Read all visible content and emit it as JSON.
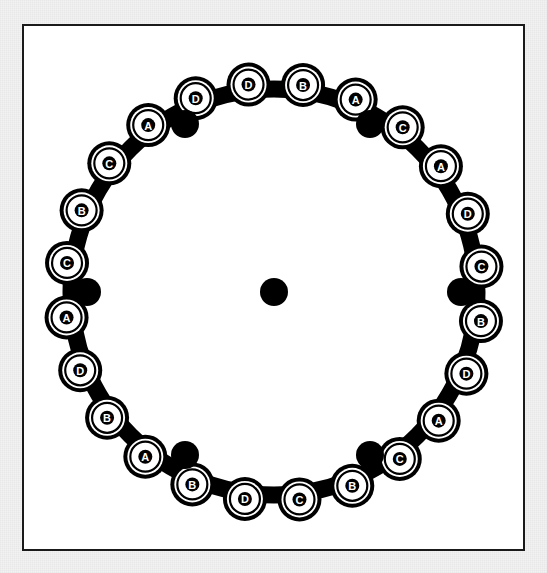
{
  "figure": {
    "type": "diagram",
    "frame": {
      "border_color": "#1a1a1a",
      "fill_color": "#ffffff",
      "mat_color": "#f1f1f1",
      "x": 22,
      "y": 24,
      "width": 503,
      "height": 527
    },
    "ring": {
      "center_x": 250,
      "center_y": 266,
      "inner_radius": 186,
      "band_radius": 203,
      "band_thickness": 17,
      "bead_orbit_radius": 209,
      "stroke_color": "#000000",
      "fill_color": "#ffffff"
    },
    "bead_style": {
      "outer_radius": 22,
      "ring_gap_radius": 18,
      "inner_ring_radius": 15,
      "letter_disc_radius": 7,
      "letter_color": "#ffffff",
      "disc_color": "#000000",
      "body_color": "#ffffff",
      "outline_color": "#000000"
    }
  },
  "beads": [
    {
      "index": 1,
      "label": "B",
      "angle_deg": -82
    },
    {
      "index": 2,
      "label": "A",
      "angle_deg": -67
    },
    {
      "index": 3,
      "label": "C",
      "angle_deg": -52
    },
    {
      "index": 4,
      "label": "A",
      "angle_deg": -37
    },
    {
      "index": 5,
      "label": "D",
      "angle_deg": -22
    },
    {
      "index": 6,
      "label": "C",
      "angle_deg": -7
    },
    {
      "index": 7,
      "label": "B",
      "angle_deg": 8
    },
    {
      "index": 8,
      "label": "D",
      "angle_deg": 23
    },
    {
      "index": 9,
      "label": "A",
      "angle_deg": 38
    },
    {
      "index": 10,
      "label": "C",
      "angle_deg": 53
    },
    {
      "index": 11,
      "label": "B",
      "angle_deg": 68
    },
    {
      "index": 12,
      "label": "C",
      "angle_deg": 83
    },
    {
      "index": 13,
      "label": "D",
      "angle_deg": 98
    },
    {
      "index": 14,
      "label": "B",
      "angle_deg": 113
    },
    {
      "index": 15,
      "label": "A",
      "angle_deg": 128
    },
    {
      "index": 16,
      "label": "B",
      "angle_deg": 143
    },
    {
      "index": 17,
      "label": "D",
      "angle_deg": 158
    },
    {
      "index": 18,
      "label": "A",
      "angle_deg": 173
    },
    {
      "index": 19,
      "label": "C",
      "angle_deg": 188
    },
    {
      "index": 20,
      "label": "B",
      "angle_deg": 203
    },
    {
      "index": 21,
      "label": "C",
      "angle_deg": 218
    },
    {
      "index": 22,
      "label": "A",
      "angle_deg": 233
    },
    {
      "index": 23,
      "label": "D",
      "angle_deg": 248
    },
    {
      "index": 24,
      "label": "D",
      "angle_deg": 263
    }
  ],
  "dots": {
    "radius": 14,
    "color": "#000000",
    "items": [
      {
        "name": "dot-center",
        "x": 250,
        "y": 266
      },
      {
        "name": "dot-upper-left",
        "x": 161,
        "y": 98
      },
      {
        "name": "dot-upper-right",
        "x": 346,
        "y": 98
      },
      {
        "name": "dot-left",
        "x": 63,
        "y": 266
      },
      {
        "name": "dot-right",
        "x": 437,
        "y": 266
      },
      {
        "name": "dot-lower-left",
        "x": 161,
        "y": 429
      },
      {
        "name": "dot-lower-right",
        "x": 346,
        "y": 429
      }
    ]
  },
  "legend": {
    "labels_used": [
      "A",
      "B",
      "C",
      "D"
    ],
    "counts": {
      "A": 6,
      "B": 6,
      "C": 6,
      "D": 6
    },
    "total_beads": 24
  }
}
